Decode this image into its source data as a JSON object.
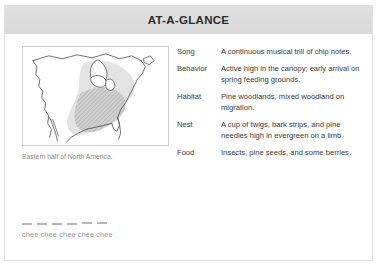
{
  "card": {
    "title": "AT-A-GLANCE"
  },
  "map": {
    "icon": "range-map",
    "caption": "Eastern half of North America.",
    "colors": {
      "coastline": "#4a4a4a",
      "range_light": "#d7d7d7",
      "range_hatched": "#b9b9b9",
      "frame": "#cfcfcf"
    }
  },
  "facts": [
    {
      "label": "Song",
      "value": "A continuous musical trill of chip notes."
    },
    {
      "label": "Behavior",
      "value": "Active high in the canopy; early arrival on spring feeding grounds."
    },
    {
      "label": "Habitat",
      "value": "Pine woodlands, mixed woodland on migration."
    },
    {
      "label": "Nest",
      "value": "A cup of twigs, bark strips, and pine needles high in evergreen on a limb."
    },
    {
      "label": "Food",
      "value": "Insects, pine seeds, and some berries."
    }
  ],
  "song_notation": {
    "marks": 6,
    "syllables": "chee chee chee chee chee"
  },
  "colors": {
    "header_band": "#dddddd",
    "title_text": "#2b2b2b",
    "body_text": "#3a3a3a",
    "muted_text": "#9a9a9a",
    "card_border": "#e2e2e2",
    "page_background": "#ffffff"
  }
}
